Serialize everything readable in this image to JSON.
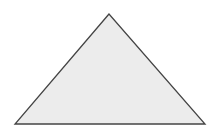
{
  "diagram": {
    "shape": "triangle",
    "vertices": {
      "apex": [
        109,
        14
      ],
      "bottom_left": [
        15,
        124
      ],
      "bottom_right": [
        205,
        124
      ]
    },
    "colors": {
      "background": "#ffffff",
      "fill": "#ececec",
      "stroke": "#444444"
    },
    "stroke_width": 1.3
  }
}
